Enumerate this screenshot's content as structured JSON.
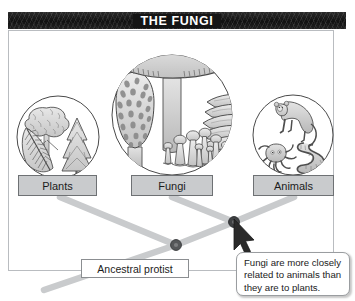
{
  "figure": {
    "title": "THE FUNGI",
    "frame_border_color": "#b9bcc0",
    "title_bar_color": "#1a1a1a"
  },
  "taxa": [
    {
      "id": "plants",
      "label": "Plants",
      "illustration": "plants-circle-icon",
      "organisms": [
        "tree",
        "fern-frond",
        "conifer"
      ]
    },
    {
      "id": "fungi",
      "label": "Fungi",
      "illustration": "fungi-circle-icon",
      "organisms": [
        "cap-mushroom",
        "morel-mushroom",
        "bracket-fungus",
        "small-mushroom-cluster"
      ]
    },
    {
      "id": "animals",
      "label": "Animals",
      "illustration": "animals-circle-icon",
      "organisms": [
        "monkey",
        "octopus",
        "worm"
      ]
    }
  ],
  "tree": {
    "root_label": "Ancestral protist",
    "node_color": "#4a4a4a",
    "branch_color": "#c4c6c8",
    "nodes": [
      {
        "id": "ancestral-protist-node",
        "x": 176,
        "y": 245
      },
      {
        "id": "fungi-animals-node",
        "x": 234,
        "y": 222
      }
    ]
  },
  "callout": {
    "text": "Fungi are more closely related to animals than they are to plants.",
    "pointer": "cursor-arrow-icon"
  }
}
